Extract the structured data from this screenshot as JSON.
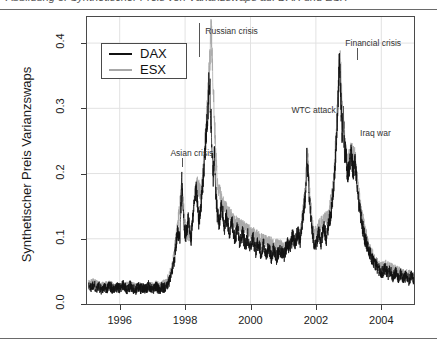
{
  "caption": {
    "text": "Abbildung 5: Synthetischer Preis von Varianzswaps auf DAX und ESX"
  },
  "chart_data": {
    "type": "line",
    "title": "",
    "xlabel": "",
    "ylabel": "Synthetischer Preis Varianzswaps",
    "xlim": [
      1995.0,
      2005.0
    ],
    "ylim": [
      0.0,
      0.44
    ],
    "xticks": [
      "1996",
      "1998",
      "2000",
      "2002",
      "2004"
    ],
    "xtick_values": [
      1996,
      1998,
      2000,
      2002,
      2004
    ],
    "yticks": [
      "0.0",
      "0.1",
      "0.2",
      "0.3",
      "0.4"
    ],
    "ytick_values": [
      0.0,
      0.1,
      0.2,
      0.3,
      0.4
    ],
    "grid": true,
    "legend_position": "top-left",
    "series": [
      {
        "name": "DAX",
        "color": "#111111",
        "x": [
          1995.05,
          1995.12,
          1995.2,
          1995.28,
          1995.36,
          1995.44,
          1995.52,
          1995.6,
          1995.68,
          1995.76,
          1995.84,
          1995.92,
          1996.0,
          1996.08,
          1996.16,
          1996.24,
          1996.32,
          1996.4,
          1996.48,
          1996.56,
          1996.64,
          1996.72,
          1996.8,
          1996.88,
          1996.96,
          1997.04,
          1997.12,
          1997.2,
          1997.28,
          1997.36,
          1997.44,
          1997.52,
          1997.6,
          1997.68,
          1997.76,
          1997.84,
          1997.9,
          1997.96,
          1998.02,
          1998.1,
          1998.18,
          1998.26,
          1998.34,
          1998.42,
          1998.5,
          1998.58,
          1998.64,
          1998.7,
          1998.74,
          1998.78,
          1998.82,
          1998.86,
          1998.9,
          1998.94,
          1998.98,
          1999.04,
          1999.12,
          1999.2,
          1999.28,
          1999.36,
          1999.44,
          1999.52,
          1999.6,
          1999.68,
          1999.76,
          1999.84,
          1999.92,
          2000.0,
          2000.08,
          2000.16,
          2000.24,
          2000.32,
          2000.4,
          2000.48,
          2000.56,
          2000.64,
          2000.72,
          2000.8,
          2000.88,
          2000.96,
          2001.04,
          2001.12,
          2001.2,
          2001.28,
          2001.36,
          2001.44,
          2001.52,
          2001.6,
          2001.68,
          2001.72,
          2001.76,
          2001.82,
          2001.88,
          2001.94,
          2002.0,
          2002.08,
          2002.16,
          2002.24,
          2002.32,
          2002.4,
          2002.48,
          2002.56,
          2002.62,
          2002.68,
          2002.72,
          2002.76,
          2002.8,
          2002.84,
          2002.88,
          2002.92,
          2002.96,
          2003.02,
          2003.08,
          2003.14,
          2003.2,
          2003.26,
          2003.32,
          2003.4,
          2003.48,
          2003.56,
          2003.64,
          2003.72,
          2003.8,
          2003.88,
          2003.96,
          2004.04,
          2004.12,
          2004.2,
          2004.28,
          2004.36,
          2004.44,
          2004.52,
          2004.6,
          2004.68,
          2004.76,
          2004.84,
          2004.92,
          2005.0
        ],
        "y": [
          0.028,
          0.025,
          0.031,
          0.024,
          0.027,
          0.022,
          0.026,
          0.023,
          0.029,
          0.024,
          0.021,
          0.026,
          0.023,
          0.03,
          0.025,
          0.022,
          0.028,
          0.024,
          0.021,
          0.027,
          0.023,
          0.026,
          0.022,
          0.028,
          0.024,
          0.023,
          0.027,
          0.022,
          0.026,
          0.024,
          0.03,
          0.035,
          0.048,
          0.072,
          0.11,
          0.098,
          0.19,
          0.12,
          0.105,
          0.13,
          0.095,
          0.15,
          0.175,
          0.125,
          0.16,
          0.21,
          0.255,
          0.3,
          0.355,
          0.3,
          0.245,
          0.195,
          0.23,
          0.17,
          0.14,
          0.125,
          0.15,
          0.118,
          0.135,
          0.105,
          0.125,
          0.098,
          0.115,
          0.092,
          0.11,
          0.088,
          0.105,
          0.085,
          0.1,
          0.082,
          0.095,
          0.078,
          0.092,
          0.075,
          0.088,
          0.072,
          0.086,
          0.07,
          0.084,
          0.08,
          0.075,
          0.095,
          0.085,
          0.105,
          0.09,
          0.11,
          0.095,
          0.13,
          0.165,
          0.23,
          0.2,
          0.15,
          0.115,
          0.095,
          0.09,
          0.11,
          0.095,
          0.12,
          0.1,
          0.125,
          0.145,
          0.19,
          0.25,
          0.31,
          0.375,
          0.32,
          0.26,
          0.29,
          0.22,
          0.24,
          0.195,
          0.21,
          0.23,
          0.205,
          0.215,
          0.18,
          0.15,
          0.125,
          0.105,
          0.09,
          0.078,
          0.07,
          0.062,
          0.056,
          0.05,
          0.048,
          0.055,
          0.045,
          0.052,
          0.042,
          0.05,
          0.04,
          0.046,
          0.038,
          0.044,
          0.036,
          0.042,
          0.038
        ]
      },
      {
        "name": "ESX",
        "color": "#a8a8a8",
        "x": [
          1995.05,
          1995.2,
          1995.36,
          1995.52,
          1995.68,
          1995.84,
          1996.0,
          1996.16,
          1996.32,
          1996.48,
          1996.64,
          1996.8,
          1996.96,
          1997.12,
          1997.28,
          1997.44,
          1997.6,
          1997.76,
          1997.9,
          1998.02,
          1998.18,
          1998.34,
          1998.5,
          1998.64,
          1998.74,
          1998.8,
          1998.86,
          1998.92,
          1998.98,
          1999.12,
          1999.28,
          1999.44,
          1999.6,
          1999.76,
          1999.92,
          2000.08,
          2000.24,
          2000.4,
          2000.56,
          2000.72,
          2000.88,
          2001.04,
          2001.2,
          2001.36,
          2001.52,
          2001.68,
          2001.74,
          2001.82,
          2001.94,
          2002.08,
          2002.24,
          2002.4,
          2002.56,
          2002.68,
          2002.74,
          2002.8,
          2002.88,
          2002.96,
          2003.08,
          2003.2,
          2003.32,
          2003.48,
          2003.64,
          2003.8,
          2003.96,
          2004.12,
          2004.28,
          2004.44,
          2004.6,
          2004.76,
          2004.92,
          2005.0
        ],
        "y": [
          0.03,
          0.032,
          0.028,
          0.027,
          0.03,
          0.025,
          0.026,
          0.027,
          0.029,
          0.025,
          0.026,
          0.024,
          0.027,
          0.029,
          0.028,
          0.034,
          0.055,
          0.115,
          0.175,
          0.112,
          0.1,
          0.185,
          0.17,
          0.265,
          0.36,
          0.425,
          0.33,
          0.255,
          0.185,
          0.16,
          0.142,
          0.132,
          0.122,
          0.118,
          0.112,
          0.108,
          0.102,
          0.098,
          0.094,
          0.092,
          0.09,
          0.085,
          0.092,
          0.098,
          0.105,
          0.175,
          0.235,
          0.16,
          0.105,
          0.118,
          0.128,
          0.135,
          0.2,
          0.32,
          0.385,
          0.3,
          0.255,
          0.215,
          0.235,
          0.225,
          0.165,
          0.118,
          0.085,
          0.068,
          0.056,
          0.06,
          0.056,
          0.052,
          0.048,
          0.046,
          0.044,
          0.042
        ]
      }
    ],
    "annotations": [
      {
        "label": "Asian crisis",
        "x": 1997.55,
        "y": 0.232,
        "leader": "below",
        "leader_len": 9
      },
      {
        "label": "Russian crisis",
        "x": 1998.62,
        "y": 0.418,
        "leader": "left",
        "leader_len": 34
      },
      {
        "label": "WTC attack",
        "x": 2001.25,
        "y": 0.298,
        "leader": "right",
        "leader_len": 26
      },
      {
        "label": "Financial crisis",
        "x": 2002.9,
        "y": 0.4,
        "leader": "below",
        "leader_len": 12
      },
      {
        "label": "Iraq war",
        "x": 2003.35,
        "y": 0.262,
        "leader": "none",
        "leader_len": 0
      }
    ]
  },
  "legend": {
    "items": [
      {
        "label": "DAX",
        "color": "#111111"
      },
      {
        "label": "ESX",
        "color": "#a8a8a8"
      }
    ]
  }
}
